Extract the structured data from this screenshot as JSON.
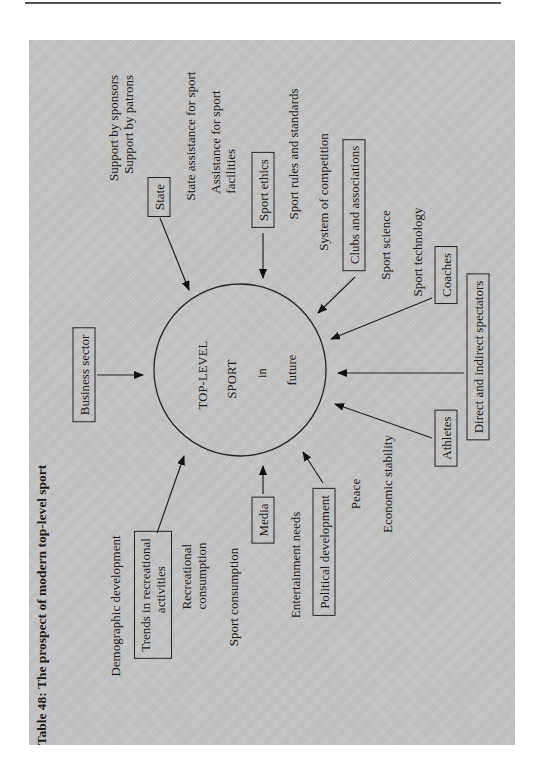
{
  "page": {
    "caption": "Table 48: The prospect of modern top-level sport"
  },
  "diagram": {
    "center": {
      "lines": [
        "TOP-LEVEL",
        "SPORT",
        "in",
        "future"
      ]
    },
    "boxes": {
      "business_sector": "Business sector",
      "state": "State",
      "sport_ethics": "Sport ethics",
      "clubs_associations": "Clubs and associations",
      "coaches": "Coaches",
      "spectators": "Direct and indirect spectators",
      "athletes": "Athletes",
      "political_development": "Political development",
      "media": "Media",
      "trends_recreational": [
        "Trends in recreational",
        "activities"
      ]
    },
    "labels": {
      "support_sponsors": "Support by sponsors",
      "support_patrons": "Support by patrons",
      "state_assistance": "State assistance for sport",
      "assistance_facilities": [
        "Assistance for sport",
        "facilities"
      ],
      "sport_rules": "Sport rules and standards",
      "system_competition": "System of competition",
      "sport_science": "Sport science",
      "sport_technology": "Sport technology",
      "economic_stability": "Economic stability",
      "peace": "Peace",
      "entertainment_needs": "Entertainment needs",
      "sport_consumption": "Sport consumption",
      "recreational_consumption": [
        "Recreational",
        "consumption"
      ],
      "demographic_development": "Demographic development"
    },
    "colors": {
      "panel": "#c4c4c4",
      "ink": "#1a1a1a",
      "rule": "#555555"
    }
  }
}
